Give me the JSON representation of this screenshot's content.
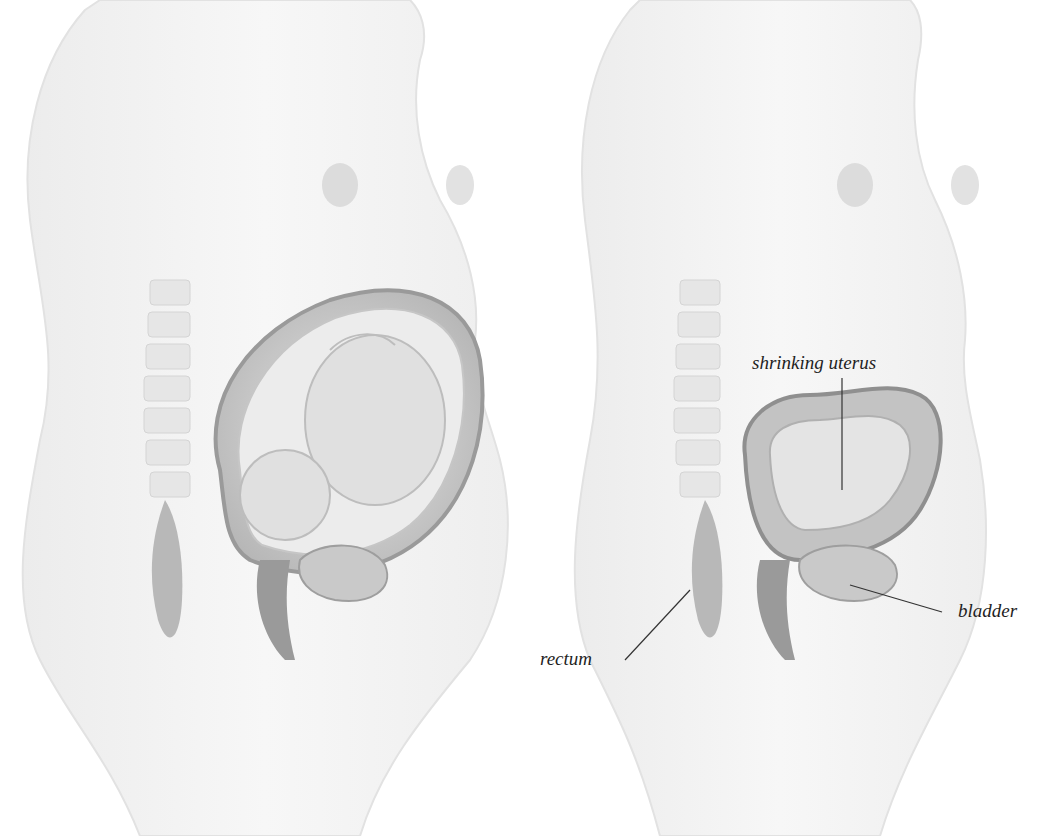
{
  "figure": {
    "panels": [
      {
        "id": "left",
        "description": "Pregnant torso with uterus containing fetus"
      },
      {
        "id": "right",
        "description": "Postpartum torso with shrinking uterus"
      }
    ],
    "labels": {
      "uterus": "shrinking uterus",
      "rectum": "rectum",
      "bladder": "bladder"
    },
    "colors": {
      "skin": "#f3f3f3",
      "outline": "#d9d9d9",
      "tissue": "#bdbdbd",
      "tissue_dark": "#8e8e8e",
      "leader": "#333333"
    }
  }
}
